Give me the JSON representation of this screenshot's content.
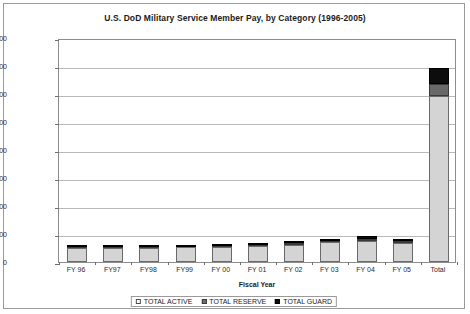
{
  "chart_data": {
    "type": "bar",
    "subtype": "stacked",
    "title": "U.S. DoD Military Service Member Pay, by Category (1996-2005)",
    "xlabel": "Fiscal Year",
    "ylabel": "Millions of Current U.S. $",
    "ylim": [
      0,
      800000
    ],
    "ytick_step": 100000,
    "yticks": [
      "800000",
      "700000",
      "600000",
      "500000",
      "400000",
      "300000",
      "200000",
      "100000",
      "0"
    ],
    "grid": true,
    "legend_position": "bottom",
    "categories": [
      "FY 96",
      "FY97",
      "FY98",
      "FY99",
      "FY 00",
      "FY 01",
      "FY 02",
      "FY 03",
      "FY 04",
      "FY 05",
      "Total"
    ],
    "series": [
      {
        "name": "TOTAL ACTIVE",
        "color": "#d4d4d4",
        "values": [
          51000,
          51000,
          51000,
          52000,
          54000,
          57000,
          62000,
          70000,
          76000,
          69000,
          593000
        ]
      },
      {
        "name": "TOTAL RESERVE",
        "color": "#696969",
        "values": [
          3000,
          3000,
          3000,
          3000,
          3000,
          4000,
          5000,
          6000,
          7000,
          6000,
          43000
        ]
      },
      {
        "name": "TOTAL GUARD",
        "color": "#0d0d0d",
        "values": [
          4000,
          4000,
          4000,
          4000,
          4000,
          5000,
          6000,
          8000,
          9000,
          8000,
          57000
        ]
      }
    ],
    "totals": [
      58000,
      58000,
      58000,
      59000,
      61000,
      66000,
      73000,
      84000,
      92000,
      83000,
      693000
    ]
  },
  "legend": {
    "items": [
      {
        "label": "TOTAL ACTIVE"
      },
      {
        "label": "TOTAL RESERVE"
      },
      {
        "label": "TOTAL GUARD"
      }
    ]
  },
  "colors": {
    "active": "#d4d4d4",
    "reserve": "#696969",
    "guard": "#0d0d0d",
    "grid": "#b9b9b9",
    "border": "#9a9a9a",
    "text": "#1b1b1b"
  }
}
